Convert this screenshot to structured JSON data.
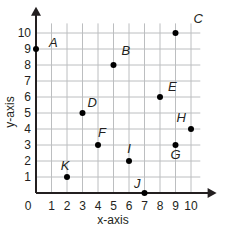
{
  "chart_data": {
    "type": "scatter",
    "title": "",
    "xlabel": "x-axis",
    "ylabel": "y-axis",
    "xlim": [
      0,
      10
    ],
    "ylim": [
      0,
      10
    ],
    "grid": true,
    "x_ticks": [
      "0",
      "1",
      "2",
      "3",
      "4",
      "5",
      "6",
      "7",
      "8",
      "9",
      "10"
    ],
    "y_ticks": [
      "1",
      "2",
      "3",
      "4",
      "5",
      "6",
      "7",
      "8",
      "9",
      "10"
    ],
    "points": [
      {
        "label": "A",
        "x": 0,
        "y": 9
      },
      {
        "label": "B",
        "x": 5,
        "y": 8
      },
      {
        "label": "C",
        "x": 9,
        "y": 10
      },
      {
        "label": "D",
        "x": 3,
        "y": 5
      },
      {
        "label": "E",
        "x": 8,
        "y": 6
      },
      {
        "label": "F",
        "x": 4,
        "y": 3
      },
      {
        "label": "G",
        "x": 9,
        "y": 3
      },
      {
        "label": "H",
        "x": 10,
        "y": 4
      },
      {
        "label": "I",
        "x": 6,
        "y": 2
      },
      {
        "label": "J",
        "x": 7,
        "y": 0
      },
      {
        "label": "K",
        "x": 2,
        "y": 1
      }
    ]
  },
  "colors": {
    "grid": "#bcbec0",
    "axis": "#231f20",
    "point": "#000000"
  }
}
